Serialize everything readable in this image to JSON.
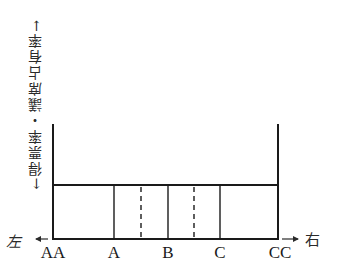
{
  "diagram": {
    "type": "spatial-model-of-party-positions",
    "vertical_axis_label": "←得票率・議席占有率→",
    "horizontal_axis": {
      "left_label": "左",
      "right_label": "右"
    },
    "positions": [
      {
        "label": "AA",
        "x": 53,
        "line": "solid-edge"
      },
      {
        "label": "A",
        "x": 114,
        "line": "solid"
      },
      {
        "label": "B",
        "x": 168,
        "line": "solid"
      },
      {
        "label": "C",
        "x": 220,
        "line": "solid"
      },
      {
        "label": "CC",
        "x": 278,
        "line": "solid-edge"
      }
    ],
    "dashed_dividers_x": [
      141,
      194
    ],
    "box": {
      "left": 53,
      "right": 278,
      "top": 185,
      "bottom": 239
    },
    "edge_top": 124,
    "line_color": "#1a1a1a"
  }
}
